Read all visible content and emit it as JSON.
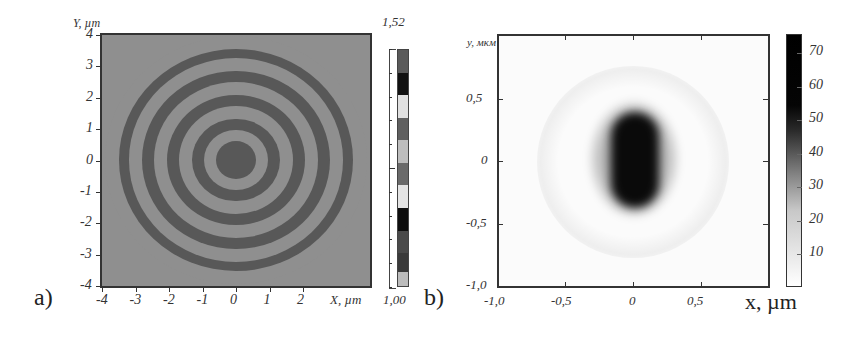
{
  "chart_data": [
    {
      "panel": "a)",
      "type": "heatmap",
      "title": "",
      "xlabel": "X, µm",
      "ylabel": "Y, µm",
      "xlim": [
        -4,
        4
      ],
      "ylim": [
        -4,
        4
      ],
      "x_ticks": [
        "-4",
        "-3",
        "-2",
        "-1",
        "0",
        "1",
        "2"
      ],
      "y_ticks": [
        "4",
        "3",
        "2",
        "1",
        "0",
        "-1",
        "-2",
        "-3",
        "-4"
      ],
      "description": "Concentric-ring binary zone pattern centered at (0,0); dark central disk radius ~0.6 µm, alternating dark/light rings out to radius ~4 µm",
      "ring_radii_um": [
        0.6,
        0.95,
        1.3,
        1.7,
        2.05,
        2.45,
        2.8,
        3.2,
        3.5,
        3.9
      ],
      "colorbar": {
        "min_label": "1,00",
        "max_label": "1,52",
        "min": 1.0,
        "max": 1.52,
        "segments_top_to_bottom": [
          "#5a5a5a",
          "#111111",
          "#e0e0e0",
          "#606060",
          "#bdbdbd",
          "#6a6a6a",
          "#e4e4e4",
          "#0e0e0e",
          "#4a4a4a",
          "#3a3a3a",
          "#bcbcbc"
        ]
      },
      "grid": false
    },
    {
      "panel": "b)",
      "type": "heatmap",
      "title": "",
      "xlabel": "x, µm",
      "ylabel": "y, мкм",
      "xlim": [
        -1.0,
        1.0
      ],
      "ylim": [
        -1.0,
        1.0
      ],
      "x_ticks": [
        "-1,0",
        "-0,5",
        "0",
        "0,5"
      ],
      "y_ticks": [
        "0,5",
        "0",
        "-0,5",
        "-1,0"
      ],
      "description": "Intensity focal spot: dark elongated peak at center, ~0.35 µm wide in x and ~0.7 µm tall in y; peak ~75; faint halo ring around radius ~0.7 µm",
      "peak_value": 75,
      "colorbar": {
        "tick_labels": [
          "70",
          "60",
          "50",
          "40",
          "30",
          "20",
          "10"
        ],
        "min": 0,
        "max": 75,
        "colormap": "white-to-black grayscale"
      },
      "grid": false
    }
  ],
  "panel_a": {
    "label": "a)",
    "y_axis_title": "Y, µm",
    "x_axis_title": "X, µm",
    "x_ticks": [
      "-4",
      "-3",
      "-2",
      "-1",
      "0",
      "1",
      "2"
    ],
    "y_ticks": [
      "4",
      "3",
      "2",
      "1",
      "0",
      "-1",
      "-2",
      "-3",
      "-4"
    ],
    "cbar_max": "1,52",
    "cbar_min": "1,00"
  },
  "panel_b": {
    "label": "b)",
    "y_axis_title": "y, мкм",
    "x_axis_title": "x, µm",
    "x_ticks": [
      "-1,0",
      "-0,5",
      "0",
      "0,5"
    ],
    "y_ticks": [
      "0,5",
      "0",
      "-0,5",
      "-1,0"
    ],
    "cbar_ticks": [
      "70",
      "60",
      "50",
      "40",
      "30",
      "20",
      "10"
    ]
  },
  "colors": {
    "axis": "#333333",
    "ring_dark": "#585858",
    "ring_light": "#8f8f8f",
    "spot_core": "#0a0a0a"
  }
}
